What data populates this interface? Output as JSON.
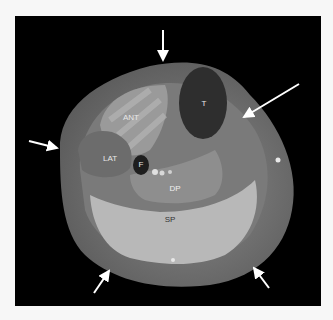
{
  "figure": {
    "type": "axial MRI cross-section of lower leg",
    "background_color": "#000000",
    "labels": [
      {
        "id": "ant",
        "text": "ANT",
        "x": 131,
        "y": 118
      },
      {
        "id": "t",
        "text": "T",
        "x": 204,
        "y": 104
      },
      {
        "id": "lat",
        "text": "LAT",
        "x": 110,
        "y": 159
      },
      {
        "id": "f",
        "text": "F",
        "x": 141,
        "y": 165
      },
      {
        "id": "dp",
        "text": "DP",
        "x": 175,
        "y": 189
      },
      {
        "id": "sp",
        "text": "SP",
        "x": 170,
        "y": 220
      }
    ],
    "arrows": [
      {
        "id": "top",
        "x1": 163,
        "y1": 30,
        "x2": 163,
        "y2": 63
      },
      {
        "id": "upper-right",
        "x1": 299,
        "y1": 84,
        "x2": 241,
        "y2": 119
      },
      {
        "id": "left",
        "x1": 29,
        "y1": 141,
        "x2": 60,
        "y2": 149
      },
      {
        "id": "bottom-left",
        "x1": 94,
        "y1": 293,
        "x2": 111,
        "y2": 268
      },
      {
        "id": "bottom-right",
        "x1": 269,
        "y1": 288,
        "x2": 252,
        "y2": 265
      }
    ]
  }
}
